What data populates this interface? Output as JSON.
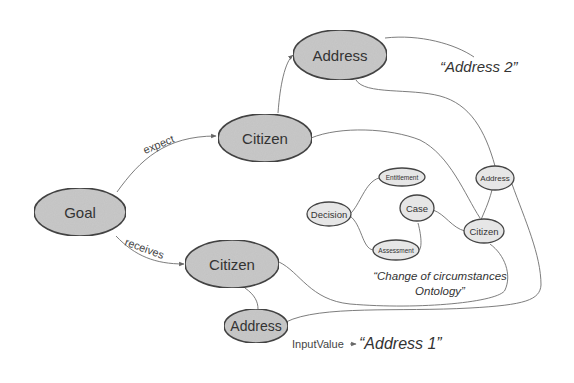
{
  "diagram": {
    "nodes": {
      "goal": "Goal",
      "citizen_expect": "Citizen",
      "address_top": "Address",
      "citizen_receives": "Citizen",
      "address_bottom": "Address",
      "ontology_decision": "Decision",
      "ontology_entitlement": "Entitlement",
      "ontology_case": "Case",
      "ontology_assessment": "Assessment",
      "ontology_citizen": "Citizen",
      "ontology_address": "Address"
    },
    "edges": {
      "expect": "expect",
      "receives": "receives",
      "input_value": "InputValue"
    },
    "values": {
      "address2": "“Address 2”",
      "address1": "“Address 1”"
    },
    "ontology_caption": {
      "line1": "“Change of circumstances",
      "line2": "Ontology”"
    },
    "colors": {
      "node_fill_big": "#c8c8c8",
      "node_fill_small": "#e6e6e6",
      "stroke": "#444444",
      "edge": "#6e6e6e"
    }
  }
}
